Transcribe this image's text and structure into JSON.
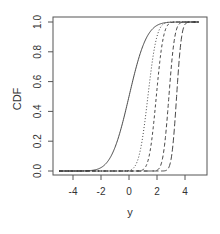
{
  "chart_data": {
    "type": "line",
    "title": "",
    "xlabel": "y",
    "ylabel": "CDF",
    "xlim": [
      -5.5,
      5.5
    ],
    "ylim": [
      0.0,
      1.0
    ],
    "grid": false,
    "legend": null,
    "x_ticks": [
      -4,
      -2,
      0,
      2,
      4
    ],
    "x_tick_labels": [
      "-4",
      "-2",
      "0",
      "2",
      "4"
    ],
    "y_ticks": [
      0.0,
      0.2,
      0.4,
      0.6,
      0.8,
      1.0
    ],
    "y_tick_labels": [
      "0.0",
      "0.2",
      "0.4",
      "0.6",
      "0.8",
      "1.0"
    ],
    "x_range_plotted": [
      -5,
      5
    ],
    "series": [
      {
        "name": "curve-1",
        "line_style": "solid",
        "approx_median": 0.0,
        "approx_scale": 1.0,
        "x": [
          -5,
          -3,
          -2,
          -1,
          0,
          1,
          2,
          3,
          5
        ],
        "values": [
          0.0,
          0.001,
          0.023,
          0.159,
          0.5,
          0.841,
          0.977,
          0.999,
          1.0
        ]
      },
      {
        "name": "curve-2",
        "line_style": "dotted",
        "approx_median": 1.35,
        "approx_scale": 0.5,
        "x": [
          -5,
          0,
          0.5,
          1,
          1.35,
          2,
          2.5,
          3,
          5
        ],
        "values": [
          0.0,
          0.003,
          0.045,
          0.242,
          0.5,
          0.903,
          0.989,
          1.0,
          1.0
        ]
      },
      {
        "name": "curve-3",
        "line_style": "dashed",
        "approx_median": 1.95,
        "approx_scale": 0.4,
        "x": [
          -5,
          0.8,
          1.2,
          1.6,
          1.95,
          2.4,
          2.8,
          3.2,
          5
        ],
        "values": [
          0.0,
          0.002,
          0.03,
          0.19,
          0.5,
          0.87,
          0.983,
          0.999,
          1.0
        ]
      },
      {
        "name": "curve-4",
        "line_style": "dashed-medium",
        "approx_median": 2.85,
        "approx_scale": 0.33,
        "x": [
          -5,
          1.9,
          2.3,
          2.6,
          2.85,
          3.2,
          3.5,
          3.9,
          5
        ],
        "values": [
          0.0,
          0.002,
          0.048,
          0.224,
          0.5,
          0.856,
          0.976,
          0.999,
          1.0
        ]
      },
      {
        "name": "curve-5",
        "line_style": "longdash",
        "approx_median": 3.4,
        "approx_scale": 0.28,
        "x": [
          -5,
          2.6,
          2.9,
          3.2,
          3.4,
          3.7,
          4.0,
          4.3,
          5
        ],
        "values": [
          0.0,
          0.002,
          0.037,
          0.238,
          0.5,
          0.858,
          0.984,
          0.999,
          1.0
        ]
      }
    ]
  },
  "style": {
    "line_color": "#333333",
    "axis_color": "#555555",
    "background": "#ffffff"
  }
}
